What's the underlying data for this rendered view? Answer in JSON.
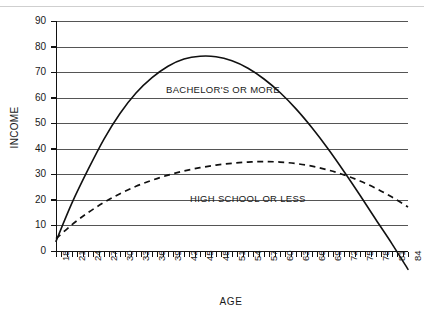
{
  "chart_data": {
    "type": "line",
    "title": "",
    "xlabel": "AGE",
    "ylabel": "INCOME",
    "xlim": [
      18,
      84
    ],
    "ylim": [
      0,
      90
    ],
    "grid": true,
    "legend_position": "inline-annotation",
    "xticks": [
      18,
      21,
      24,
      27,
      30,
      33,
      36,
      39,
      42,
      45,
      48,
      51,
      54,
      57,
      60,
      63,
      66,
      69,
      72,
      75,
      78,
      81,
      84
    ],
    "yticks": [
      0,
      10,
      20,
      30,
      40,
      50,
      60,
      70,
      80,
      90
    ],
    "minor_xtick_step": 1,
    "x": [
      18,
      21,
      24,
      27,
      30,
      33,
      36,
      39,
      42,
      45,
      48,
      51,
      54,
      57,
      60,
      63,
      66,
      69,
      72,
      75,
      78,
      81,
      84
    ],
    "series": [
      {
        "name": "BACHELOR'S OR MORE",
        "style": "solid",
        "color": "#111111",
        "values": [
          4,
          19,
          32,
          44,
          54,
          62,
          68,
          72.5,
          75.3,
          76.4,
          76.2,
          74.6,
          71.7,
          67.5,
          62.2,
          55.8,
          48.4,
          40.2,
          31.3,
          22.0,
          12.4,
          3.0,
          -7.0
        ]
      },
      {
        "name": "HIGH SCHOOL OR LESS",
        "style": "dashed",
        "color": "#111111",
        "values": [
          5,
          10.5,
          15.2,
          19.2,
          22.6,
          25.5,
          27.9,
          29.9,
          31.5,
          32.8,
          33.8,
          34.5,
          35.0,
          35.2,
          35.0,
          34.4,
          33.4,
          31.9,
          30.0,
          27.6,
          24.7,
          21.3,
          17.4
        ]
      }
    ],
    "annotations": [
      {
        "text": "BACHELOR'S OR MORE",
        "near_x": 45,
        "near_y": 66
      },
      {
        "text": "HIGH SCHOOL OR LESS",
        "near_x": 54,
        "near_y": 25
      }
    ]
  },
  "axes": {
    "y_title": "INCOME",
    "x_title": "AGE",
    "y_tick_labels": [
      "90",
      "80",
      "70",
      "60",
      "50",
      "40",
      "30",
      "20",
      "10",
      "0"
    ],
    "x_tick_labels": [
      "18",
      "21",
      "24",
      "27",
      "30",
      "33",
      "36",
      "39",
      "42",
      "45",
      "48",
      "51",
      "54",
      "57",
      "60",
      "63",
      "66",
      "69",
      "72",
      "75",
      "78",
      "81",
      "84"
    ]
  },
  "series_labels": {
    "bachelors": "BACHELOR'S OR MORE",
    "high_school": "HIGH SCHOOL OR LESS"
  },
  "colors": {
    "ink": "#111111",
    "grid": "#555555",
    "background": "#ffffff"
  }
}
